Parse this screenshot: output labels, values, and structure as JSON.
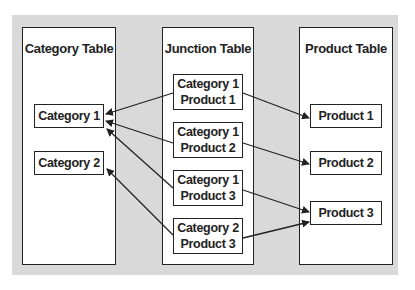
{
  "panels": {
    "category": {
      "title": "Category Table",
      "items": [
        "Category 1",
        "Category 2"
      ]
    },
    "junction": {
      "title": "Junction Table",
      "items": [
        {
          "line1": "Category 1",
          "line2": "Product 1"
        },
        {
          "line1": "Category 1",
          "line2": "Product 2"
        },
        {
          "line1": "Category 1",
          "line2": "Product 3"
        },
        {
          "line1": "Category 2",
          "line2": "Product 3"
        }
      ]
    },
    "product": {
      "title": "Product Table",
      "items": [
        "Product 1",
        "Product 2",
        "Product 3"
      ]
    }
  },
  "colors": {
    "background": "#d9d9d9",
    "panel": "#ffffff",
    "stroke": "#222222"
  }
}
